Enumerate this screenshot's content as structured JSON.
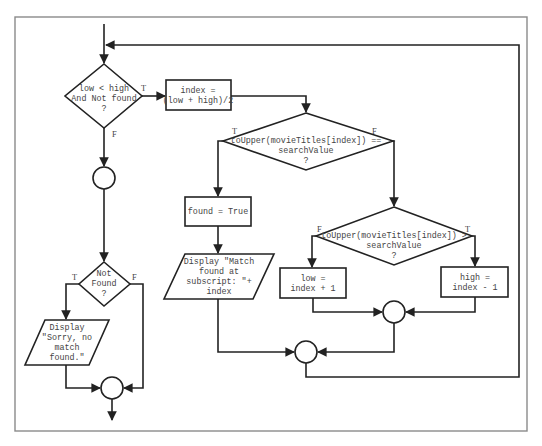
{
  "diagram": {
    "type": "flowchart",
    "nodes": {
      "cond_loop": {
        "shape": "diamond",
        "lines": [
          "low < high",
          "And Not found",
          "?"
        ],
        "true_label": "T",
        "false_label": "F"
      },
      "calc_index": {
        "shape": "process",
        "lines": [
          "index =",
          "(low + high)/2"
        ]
      },
      "cond_equal": {
        "shape": "diamond",
        "lines": [
          "toUpper(movieTitles[index]) ==",
          "searchValue",
          "?"
        ],
        "true_label": "T",
        "false_label": "F"
      },
      "set_found": {
        "shape": "process",
        "lines": [
          "found = True"
        ]
      },
      "display_match": {
        "shape": "io",
        "lines": [
          "Display \"Match",
          "found at",
          "subscript: \"+",
          "index"
        ]
      },
      "cond_greater": {
        "shape": "diamond",
        "lines": [
          "toUpper(movieTitles[index]) >",
          "searchValue",
          "?"
        ],
        "true_label": "T",
        "false_label": "F"
      },
      "set_low": {
        "shape": "process",
        "lines": [
          "low =",
          "index + 1"
        ]
      },
      "set_high": {
        "shape": "process",
        "lines": [
          "high =",
          "index - 1"
        ]
      },
      "cond_not_found": {
        "shape": "diamond",
        "lines": [
          "Not",
          "Found",
          "?"
        ],
        "true_label": "T",
        "false_label": "F"
      },
      "display_sorry": {
        "shape": "io",
        "lines": [
          "Display",
          "\"Sorry, no",
          "match",
          "found.\""
        ]
      },
      "connectors": [
        "after-loop",
        "merge-low-high",
        "merge-equal",
        "merge-not-found"
      ]
    },
    "edges": [
      {
        "from": "entry",
        "to": "cond_loop"
      },
      {
        "from": "cond_loop",
        "to": "calc_index",
        "label": "T"
      },
      {
        "from": "cond_loop",
        "to": "after-loop",
        "label": "F"
      },
      {
        "from": "calc_index",
        "to": "cond_equal"
      },
      {
        "from": "cond_equal",
        "to": "set_found",
        "label": "T"
      },
      {
        "from": "cond_equal",
        "to": "cond_greater",
        "label": "F"
      },
      {
        "from": "set_found",
        "to": "display_match"
      },
      {
        "from": "cond_greater",
        "to": "set_low",
        "label": "F"
      },
      {
        "from": "cond_greater",
        "to": "set_high",
        "label": "T"
      },
      {
        "from": "set_low",
        "to": "merge-low-high"
      },
      {
        "from": "set_high",
        "to": "merge-low-high"
      },
      {
        "from": "merge-low-high",
        "to": "merge-equal"
      },
      {
        "from": "display_match",
        "to": "merge-equal"
      },
      {
        "from": "merge-equal",
        "to": "cond_loop",
        "note": "loop back"
      },
      {
        "from": "after-loop",
        "to": "cond_not_found"
      },
      {
        "from": "cond_not_found",
        "to": "display_sorry",
        "label": "T"
      },
      {
        "from": "cond_not_found",
        "to": "merge-not-found",
        "label": "F"
      },
      {
        "from": "display_sorry",
        "to": "merge-not-found"
      },
      {
        "from": "merge-not-found",
        "to": "exit"
      }
    ]
  }
}
